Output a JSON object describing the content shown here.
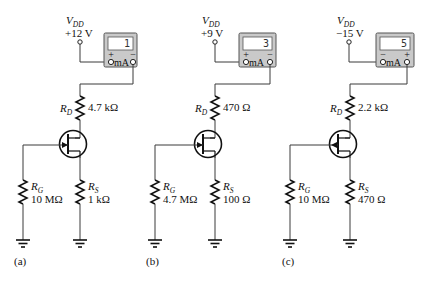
{
  "figure": {
    "type": "JFET self-bias circuits with milliammeters",
    "circuits": [
      {
        "id": "a",
        "caption": "(a)",
        "vdd": {
          "label": "V",
          "subscript": "DD",
          "value": "+12 V"
        },
        "meter": {
          "reading": "1",
          "unit": "mA",
          "left_polarity": "+",
          "right_polarity": "−"
        },
        "rd": {
          "label": "R",
          "subscript": "D",
          "value": "4.7 kΩ"
        },
        "rg": {
          "label": "R",
          "subscript": "G",
          "value": "10 MΩ"
        },
        "rs": {
          "label": "R",
          "subscript": "S",
          "value": "1 kΩ"
        },
        "jfet_channel": "n-channel"
      },
      {
        "id": "b",
        "caption": "(b)",
        "vdd": {
          "label": "V",
          "subscript": "DD",
          "value": "+9 V"
        },
        "meter": {
          "reading": "3",
          "unit": "mA",
          "left_polarity": "+",
          "right_polarity": "−"
        },
        "rd": {
          "label": "R",
          "subscript": "D",
          "value": "470 Ω"
        },
        "rg": {
          "label": "R",
          "subscript": "G",
          "value": "4.7 MΩ"
        },
        "rs": {
          "label": "R",
          "subscript": "S",
          "value": "100 Ω"
        },
        "jfet_channel": "n-channel"
      },
      {
        "id": "c",
        "caption": "(c)",
        "vdd": {
          "label": "V",
          "subscript": "DD",
          "value": "−15 V"
        },
        "meter": {
          "reading": "5",
          "unit": "mA",
          "left_polarity": "−",
          "right_polarity": "+"
        },
        "rd": {
          "label": "R",
          "subscript": "D",
          "value": "2.2 kΩ"
        },
        "rg": {
          "label": "R",
          "subscript": "G",
          "value": "10 MΩ"
        },
        "rs": {
          "label": "R",
          "subscript": "S",
          "value": "470 Ω"
        },
        "jfet_channel": "p-channel"
      }
    ]
  },
  "colors": {
    "wire": "#3a3a3a",
    "meter_body": "#c9c9c9",
    "meter_screen": "#ffffff",
    "background": "#ffffff"
  }
}
